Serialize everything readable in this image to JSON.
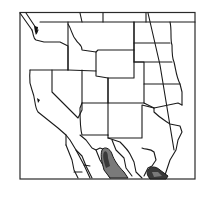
{
  "map": {
    "type": "species range map",
    "region": "Western United States and northern Mexico",
    "frame": {
      "x": 20,
      "y": 12,
      "width": 175,
      "height": 167
    },
    "colors": {
      "background": "#ffffff",
      "state_borders": "#1a1a1a",
      "range_dark": "#3a3a3a",
      "range_medium": "#7a7a7a"
    },
    "range_areas": [
      {
        "name": "western-sierra-madre-range",
        "shade": "medium"
      },
      {
        "name": "eastern-tamaulipas-range",
        "shade": "dark"
      }
    ],
    "longitude_line": "diagonal meridian across eastern states",
    "labels": []
  }
}
